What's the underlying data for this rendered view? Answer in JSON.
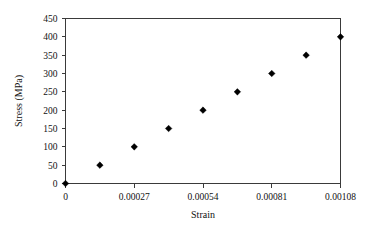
{
  "chart_data": {
    "type": "scatter",
    "title": "",
    "xlabel": "Strain",
    "ylabel": "Stress (MPa)",
    "xlim": [
      0,
      0.00108
    ],
    "ylim": [
      0,
      450
    ],
    "grid": false,
    "legend": false,
    "marker": "diamond",
    "marker_color": "#000000",
    "x": [
      0,
      0.000135,
      0.00027,
      0.000405,
      0.00054,
      0.000675,
      0.00081,
      0.000945,
      0.00108
    ],
    "values": [
      0,
      50,
      100,
      150,
      200,
      250,
      300,
      350,
      400
    ],
    "xticks": [
      0,
      0.00027,
      0.00054,
      0.00081,
      0.00108
    ],
    "xtick_labels": [
      "0",
      "0.00027",
      "0.00054",
      "0.00081",
      "0.00108"
    ],
    "yticks": [
      0,
      50,
      100,
      150,
      200,
      250,
      300,
      350,
      400,
      450
    ],
    "ytick_labels": [
      "0",
      "50",
      "100",
      "150",
      "200",
      "250",
      "300",
      "350",
      "400",
      "450"
    ]
  },
  "axes": {
    "y_title": "Stress (MPa)",
    "x_title": "Strain"
  }
}
